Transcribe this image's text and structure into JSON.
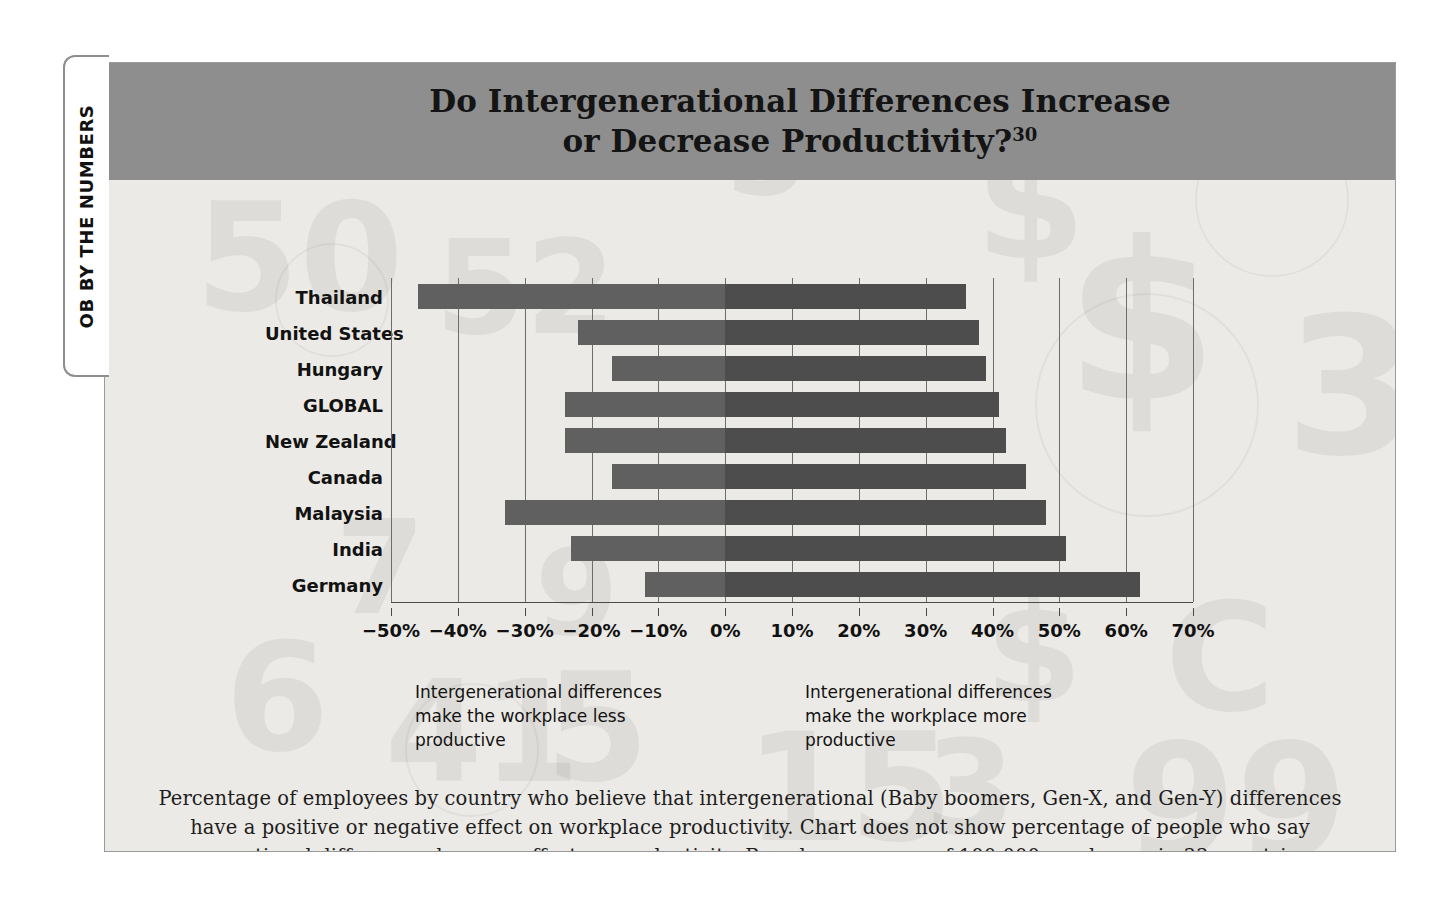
{
  "sidetab": {
    "label": "OB BY THE NUMBERS"
  },
  "header": {
    "title_line1": "Do Intergenerational Differences Increase",
    "title_line2": "or Decrease Productivity?",
    "footnote_marker": "30"
  },
  "annotations": {
    "left": "Intergenerational differences make the workplace less productive",
    "right": "Intergenerational differences make the workplace more productive"
  },
  "caption": "Percentage of employees by country who believe that intergenerational (Baby boomers, Gen-X, and Gen-Y) differences have a positive or negative effect on workplace productivity. Chart does not show percentage of people who say generational differences have no effect on productivity. Based on a survey of 100,000 employees in 33 countries.",
  "colors": {
    "title_bar": "#8e8e8e",
    "bar_positive": "#4d4d4d",
    "bar_negative": "#606060",
    "panel_background": "#eceae6",
    "gridline": "#6d6d6d"
  },
  "chart_data": {
    "type": "bar",
    "orientation": "horizontal",
    "stacked": "diverging",
    "title": "Do Intergenerational Differences Increase or Decrease Productivity?",
    "xlabel": "",
    "ylabel": "",
    "xlim": [
      -50,
      70
    ],
    "xtick_step": 10,
    "grid": true,
    "legend": false,
    "xticklabels": [
      "−50%",
      "−40%",
      "−30%",
      "−20%",
      "−10%",
      "0%",
      "10%",
      "20%",
      "30%",
      "40%",
      "50%",
      "60%",
      "70%"
    ],
    "xtickvalues": [
      -50,
      -40,
      -30,
      -20,
      -10,
      0,
      10,
      20,
      30,
      40,
      50,
      60,
      70
    ],
    "categories": [
      "Thailand",
      "United States",
      "Hungary",
      "GLOBAL",
      "New Zealand",
      "Canada",
      "Malaysia",
      "India",
      "Germany"
    ],
    "series": [
      {
        "name": "Less productive",
        "values": [
          -46,
          -22,
          -17,
          -24,
          -24,
          -17,
          -33,
          -23,
          -12
        ]
      },
      {
        "name": "More productive",
        "values": [
          36,
          38,
          39,
          41,
          42,
          45,
          48,
          51,
          62
        ]
      }
    ],
    "watermark_numbers": [
      "50",
      "5",
      "3",
      "7",
      "9",
      "4",
      "1",
      "8",
      "6",
      "2",
      "99",
      "33",
      "5",
      "0",
      "$"
    ]
  }
}
